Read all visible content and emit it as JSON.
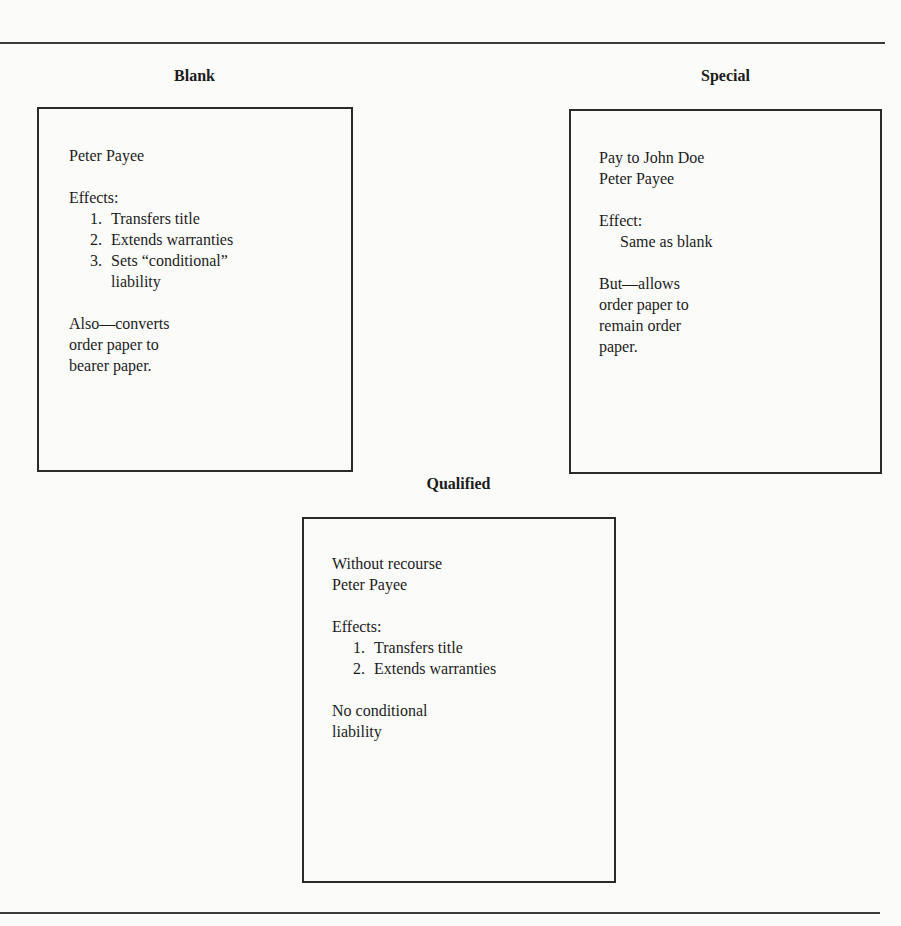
{
  "blank": {
    "heading": "Blank",
    "signature": "Peter Payee",
    "effects_label": "Effects:",
    "effects": [
      {
        "num": "1.",
        "text": "Transfers title"
      },
      {
        "num": "2.",
        "text": "Extends warranties"
      },
      {
        "num": "3.",
        "text": "Sets “conditional”",
        "cont": "liability"
      }
    ],
    "note_lines": [
      "Also—converts",
      "order paper to",
      "bearer paper."
    ]
  },
  "special": {
    "heading": "Special",
    "instruction": "Pay to John Doe",
    "signature": "Peter Payee",
    "effect_label": "Effect:",
    "effect_text": "Same as blank",
    "note_lines": [
      "But—allows",
      "order paper to",
      "remain order",
      "paper."
    ]
  },
  "qualified": {
    "heading": "Qualified",
    "instruction": "Without recourse",
    "signature": "Peter Payee",
    "effects_label": "Effects:",
    "effects": [
      {
        "num": "1.",
        "text": "Transfers title"
      },
      {
        "num": "2.",
        "text": "Extends warranties"
      }
    ],
    "note_lines": [
      "No conditional",
      "liability"
    ]
  }
}
